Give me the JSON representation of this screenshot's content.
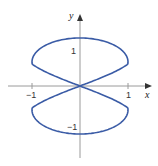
{
  "chart_data": {
    "type": "line",
    "title": "",
    "xlabel": "x",
    "ylabel": "y",
    "xlim": [
      -1.5,
      1.5
    ],
    "ylim": [
      -1.5,
      1.65
    ],
    "grid": false,
    "legend": null,
    "x_ticks": [
      {
        "value": -1,
        "label": "−1"
      },
      {
        "value": 1,
        "label": "1"
      }
    ],
    "y_ticks": [
      {
        "value": 1,
        "label": "1"
      },
      {
        "value": -1,
        "label": "−1"
      }
    ],
    "series": [
      {
        "name": "upper loop",
        "color": "#3b5ca6",
        "extent": {
          "x": [
            -1,
            1
          ],
          "y": [
            0,
            1
          ]
        },
        "widest_at_y": 0.5
      },
      {
        "name": "lower loop",
        "color": "#3b5ca6",
        "extent": {
          "x": [
            -1,
            1
          ],
          "y": [
            -1,
            0
          ]
        },
        "widest_at_y": -0.5
      }
    ]
  },
  "axes": {
    "x_label": "x",
    "y_label": "y",
    "axis_color": "#9a9a9a"
  }
}
